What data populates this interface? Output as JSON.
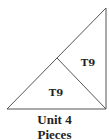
{
  "diagram": {
    "stroke_color": "#555555",
    "pieces": [
      {
        "id": "piece-1",
        "label": "T9"
      },
      {
        "id": "piece-2",
        "label": "T9"
      }
    ]
  },
  "caption": {
    "line1": "Unit 4",
    "line2": "Pieces"
  }
}
